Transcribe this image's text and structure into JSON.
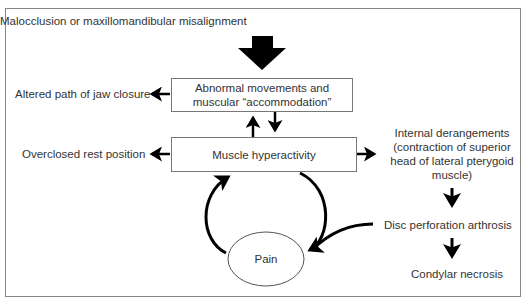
{
  "diagram": {
    "top_cause": "Malocclusion or maxillomandibular misalignment",
    "box_abnormal_line1": "Abnormal movements and",
    "box_abnormal_line2": "muscular “accommodation”",
    "box_hyperactivity": "Muscle hyperactivity",
    "left_altered": "Altered path of jaw closure",
    "left_overclosed": "Overclosed rest position",
    "right_internal_1": "Internal derangements",
    "right_internal_2": "(contraction of superior",
    "right_internal_3": "head of lateral pterygoid",
    "right_internal_4": "muscle)",
    "disc": "Disc perforation arthrosis",
    "condylar": "Condylar necrosis",
    "pain": "Pain"
  }
}
